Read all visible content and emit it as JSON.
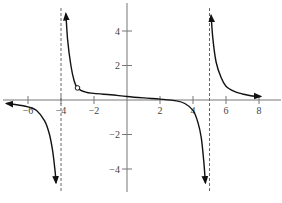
{
  "chart_data": {
    "type": "line",
    "title": "",
    "xlabel": "",
    "ylabel": "",
    "xlim": [
      -7.5,
      9
    ],
    "ylim": [
      -5.3,
      5.5
    ],
    "grid": false,
    "x_ticks": [
      -6,
      -4,
      -2,
      2,
      4,
      6,
      8
    ],
    "y_ticks": [
      4,
      2,
      -2,
      -4
    ],
    "x_tick_labels": [
      "−6",
      "−4",
      "−2",
      "2",
      "4",
      "6",
      "8"
    ],
    "y_tick_labels": [
      "4",
      "2",
      "−2",
      "−4"
    ],
    "vertical_asymptotes": [
      -4,
      5
    ],
    "horizontal_asymptote": 0,
    "hole": {
      "x": -3,
      "y": 0.7
    },
    "series": [
      {
        "name": "left-branch",
        "x": [
          -7.3,
          -6.5,
          -6,
          -5.5,
          -5,
          -4.7,
          -4.5,
          -4.35,
          -4.3
        ],
        "y": [
          -0.2,
          -0.3,
          -0.4,
          -0.6,
          -1.2,
          -2.0,
          -3.0,
          -4.2,
          -4.8
        ]
      },
      {
        "name": "middle-branch",
        "x": [
          -3.7,
          -3.6,
          -3.4,
          -3.2,
          -3,
          -2.5,
          -2,
          -1,
          0,
          1,
          2,
          3,
          3.5,
          4,
          4.3,
          4.5,
          4.65,
          4.75
        ],
        "y": [
          5.0,
          3.5,
          2.0,
          1.1,
          0.7,
          0.45,
          0.38,
          0.3,
          0.2,
          0.12,
          0.05,
          -0.05,
          -0.2,
          -0.6,
          -1.3,
          -2.2,
          -3.5,
          -4.8
        ]
      },
      {
        "name": "right-branch",
        "x": [
          5.1,
          5.2,
          5.4,
          5.7,
          6,
          6.5,
          7,
          7.5,
          8.1
        ],
        "y": [
          4.9,
          3.6,
          2.2,
          1.3,
          0.8,
          0.5,
          0.35,
          0.25,
          0.2
        ]
      }
    ]
  }
}
